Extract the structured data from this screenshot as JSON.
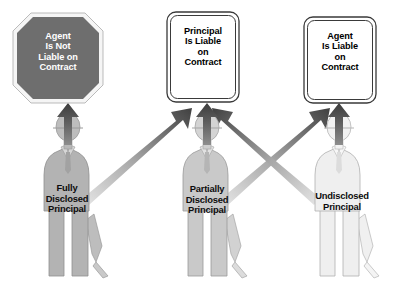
{
  "diagram": {
    "type": "flow-diagram",
    "background_color": "#ffffff"
  },
  "outcomes": [
    {
      "id": "agent-not-liable",
      "shape": "octagon",
      "lines": [
        "Agent",
        "Is Not",
        "Liable on",
        "Contract"
      ],
      "fill_color": "#6e6e6e",
      "text_color": "#ffffff",
      "border_color": "#f2f2f2"
    },
    {
      "id": "principal-liable",
      "shape": "rounded-rectangle",
      "lines": [
        "Principal",
        "Is Liable",
        "on",
        "Contract"
      ],
      "fill_color": "#ffffff",
      "text_color": "#000000",
      "border_color": "#3a3a3a"
    },
    {
      "id": "agent-liable",
      "shape": "rounded-rectangle",
      "lines": [
        "Agent",
        "Is Liable",
        "on",
        "Contract"
      ],
      "fill_color": "#ffffff",
      "text_color": "#000000",
      "border_color": "#3a3a3a"
    }
  ],
  "figures": [
    {
      "id": "fully-disclosed-principal",
      "lines": [
        "Fully",
        "Disclosed",
        "Principal"
      ],
      "fill_color": "#b3b3b3",
      "outline_color": "#8f8f8f"
    },
    {
      "id": "partially-disclosed-principal",
      "lines": [
        "Partially",
        "Disclosed",
        "Principal"
      ],
      "fill_color": "#c9c9c9",
      "outline_color": "#9a9a9a"
    },
    {
      "id": "undisclosed-principal",
      "lines": [
        "Undisclosed",
        "Principal"
      ],
      "fill_color": "#efefef",
      "outline_color": "#b0b0b0"
    }
  ],
  "connectors": [
    {
      "id": "fully-to-agent-not-liable",
      "from": "fully-disclosed-principal",
      "to": "agent-not-liable",
      "direction": "vertical-up",
      "color": "#555555"
    },
    {
      "id": "fully-to-principal-liable",
      "from": "fully-disclosed-principal",
      "to": "principal-liable",
      "direction": "diagonal-up-right",
      "gradient": [
        "#e2e2e2",
        "#4a4a4a"
      ]
    },
    {
      "id": "partially-to-principal-liable",
      "from": "partially-disclosed-principal",
      "to": "principal-liable",
      "direction": "vertical-up",
      "color": "#555555"
    },
    {
      "id": "partially-to-agent-liable",
      "from": "partially-disclosed-principal",
      "to": "agent-liable",
      "direction": "diagonal-up-right",
      "gradient": [
        "#e2e2e2",
        "#4a4a4a"
      ]
    },
    {
      "id": "undisclosed-to-principal-liable",
      "from": "undisclosed-principal",
      "to": "principal-liable",
      "direction": "diagonal-up-left",
      "gradient": [
        "#e2e2e2",
        "#4a4a4a"
      ]
    },
    {
      "id": "undisclosed-to-agent-liable",
      "from": "undisclosed-principal",
      "to": "agent-liable",
      "direction": "vertical-up",
      "color": "#555555"
    }
  ]
}
